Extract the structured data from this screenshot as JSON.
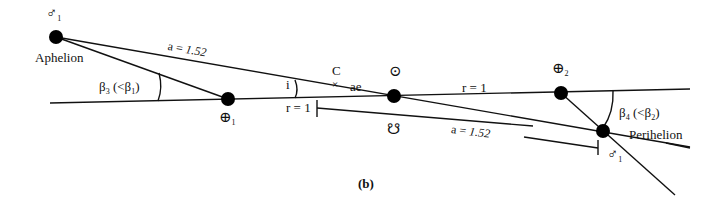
{
  "figure": {
    "caption": "(b)",
    "colors": {
      "line": "#111111",
      "dot": "#000000",
      "background": "#ffffff"
    }
  },
  "labels": {
    "mars_aphelion_symbol": "♂",
    "mars_aphelion_sub": "1",
    "aphelion": "Aphelion",
    "a_top": "a = ",
    "a_top_value": "1.52",
    "beta3": "β",
    "beta3_sub": "3",
    "beta3_rest": " (<β",
    "beta3_rest_sub": "1",
    "beta3_close": ")",
    "earth1_symbol": "⊕",
    "earth1_sub": "1",
    "i": "i",
    "r_left": "r = 1",
    "c": "C",
    "c_mark": "×",
    "ae": "ae",
    "sun_symbol": "⊙",
    "node_symbol": "☋",
    "r_right": "r = 1",
    "a_bottom": "a = ",
    "a_bottom_value": "1.52",
    "earth2_symbol": "⊕",
    "earth2_sub": "2",
    "beta4": "β",
    "beta4_sub": "4",
    "beta4_rest": " (<β",
    "beta4_rest_sub": "2",
    "beta4_close": ")",
    "perihelion": "Perihelion",
    "mars_perihelion_symbol": "♂",
    "mars_perihelion_sub": "1"
  }
}
